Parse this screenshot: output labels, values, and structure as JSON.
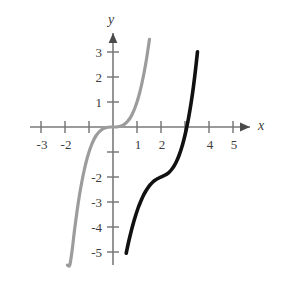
{
  "figure": {
    "width": 287,
    "height": 283,
    "background": "#ffffff"
  },
  "axes": {
    "x_axis_label": "x",
    "y_axis_label": "y",
    "axis_color": "#7a7a7a",
    "label_color": "#3c3c3c",
    "origin_px": [
      113,
      127
    ],
    "unit_px_x": 24,
    "unit_px_y": 25,
    "x_ticks": [
      {
        "value": -3,
        "label": "-3",
        "shown": true
      },
      {
        "value": -2,
        "label": "-2",
        "shown": true
      },
      {
        "value": -1,
        "label": "",
        "shown": false
      },
      {
        "value": 1,
        "label": "1",
        "shown": true
      },
      {
        "value": 2,
        "label": "2",
        "shown": true
      },
      {
        "value": 3,
        "label": "",
        "shown": false
      },
      {
        "value": 4,
        "label": "4",
        "shown": true
      },
      {
        "value": 5,
        "label": "5",
        "shown": true
      }
    ],
    "y_ticks": [
      {
        "value": 3,
        "label": "3",
        "shown": true
      },
      {
        "value": 2,
        "label": "2",
        "shown": true
      },
      {
        "value": 1,
        "label": "1",
        "shown": true
      },
      {
        "value": -1,
        "label": "",
        "shown": false
      },
      {
        "value": -2,
        "label": "-2",
        "shown": true
      },
      {
        "value": -3,
        "label": "-3",
        "shown": true
      },
      {
        "value": -4,
        "label": "-4",
        "shown": true
      },
      {
        "value": -5,
        "label": "-5",
        "shown": true
      }
    ]
  },
  "chart_data": {
    "type": "line",
    "title": "",
    "xlabel": "x",
    "ylabel": "y",
    "xlim": [
      -3.6,
      5.7
    ],
    "ylim": [
      -5.6,
      3.9
    ],
    "grid": false,
    "legend": "none",
    "series": [
      {
        "name": "y = x^3",
        "color": "#9c9c9c",
        "linewidth": 3.2,
        "inflection_point": [
          0,
          0
        ],
        "x_intercepts": [
          0
        ],
        "y_intercept": 0,
        "x_range": [
          -2.32,
          1.52
        ],
        "points": [
          [
            -2.32,
            -12.49
          ],
          [
            -2.2,
            -10.65
          ],
          [
            -2.1,
            -9.26
          ],
          [
            -2.0,
            -8.0
          ],
          [
            -1.9,
            -6.86
          ],
          [
            -1.8,
            -5.83
          ],
          [
            -1.7,
            -4.91
          ],
          [
            -1.6,
            -4.1
          ],
          [
            -1.5,
            -3.38
          ],
          [
            -1.4,
            -2.74
          ],
          [
            -1.3,
            -2.2
          ],
          [
            -1.2,
            -1.73
          ],
          [
            -1.1,
            -1.33
          ],
          [
            -1.0,
            -1.0
          ],
          [
            -0.9,
            -0.73
          ],
          [
            -0.8,
            -0.51
          ],
          [
            -0.7,
            -0.34
          ],
          [
            -0.6,
            -0.22
          ],
          [
            -0.5,
            -0.13
          ],
          [
            -0.4,
            -0.06
          ],
          [
            -0.3,
            -0.03
          ],
          [
            -0.2,
            -0.01
          ],
          [
            -0.1,
            0.0
          ],
          [
            0.0,
            0.0
          ],
          [
            0.1,
            0.0
          ],
          [
            0.2,
            0.01
          ],
          [
            0.3,
            0.03
          ],
          [
            0.4,
            0.06
          ],
          [
            0.5,
            0.13
          ],
          [
            0.6,
            0.22
          ],
          [
            0.7,
            0.34
          ],
          [
            0.8,
            0.51
          ],
          [
            0.9,
            0.73
          ],
          [
            1.0,
            1.0
          ],
          [
            1.1,
            1.33
          ],
          [
            1.2,
            1.73
          ],
          [
            1.3,
            2.2
          ],
          [
            1.4,
            2.74
          ],
          [
            1.52,
            3.51
          ]
        ]
      },
      {
        "name": "y = (x - 2)^3 - 2",
        "color": "#111111",
        "linewidth": 3.6,
        "inflection_point": [
          2,
          -2
        ],
        "x_intercepts": [
          3.26
        ],
        "y_intercept": -10,
        "x_range": [
          0.55,
          3.52
        ],
        "points": [
          [
            0.55,
            -5.05
          ],
          [
            0.65,
            -4.6
          ],
          [
            0.75,
            -4.2
          ],
          [
            0.85,
            -3.84
          ],
          [
            0.95,
            -3.52
          ],
          [
            1.05,
            -3.23
          ],
          [
            1.15,
            -2.99
          ],
          [
            1.25,
            -2.77
          ],
          [
            1.35,
            -2.59
          ],
          [
            1.45,
            -2.44
          ],
          [
            1.55,
            -2.31
          ],
          [
            1.65,
            -2.21
          ],
          [
            1.75,
            -2.13
          ],
          [
            1.85,
            -2.07
          ],
          [
            1.95,
            -2.02
          ],
          [
            2.0,
            -2.0
          ],
          [
            2.05,
            -1.98
          ],
          [
            2.15,
            -1.93
          ],
          [
            2.25,
            -1.88
          ],
          [
            2.35,
            -1.8
          ],
          [
            2.45,
            -1.69
          ],
          [
            2.55,
            -1.55
          ],
          [
            2.65,
            -1.37
          ],
          [
            2.75,
            -1.14
          ],
          [
            2.85,
            -0.86
          ],
          [
            2.95,
            -0.52
          ],
          [
            3.05,
            -0.11
          ],
          [
            3.15,
            0.37
          ],
          [
            3.26,
            1.0
          ],
          [
            3.35,
            1.6
          ],
          [
            3.45,
            2.39
          ],
          [
            3.52,
            3.01
          ]
        ]
      }
    ],
    "annotations": [
      {
        "text": "black curve is the gray curve shifted right 2 and down 2",
        "visible": false
      }
    ]
  }
}
